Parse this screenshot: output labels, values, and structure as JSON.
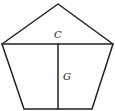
{
  "diagram": {
    "type": "pentagon-decomposition",
    "stroke_color": "#222222",
    "background": "#ffffff",
    "vertices": {
      "apex": [
        58,
        4
      ],
      "left": [
        2,
        44
      ],
      "right": [
        113,
        44
      ],
      "bottom_left": [
        24,
        109
      ],
      "bottom_right": [
        92,
        109
      ]
    },
    "segments": [
      {
        "name": "horizontal-diagonal",
        "from": "left",
        "to": "right",
        "label": "C"
      },
      {
        "name": "vertical-height",
        "from": [
          58,
          44
        ],
        "to": [
          58,
          109
        ],
        "label": "G"
      }
    ],
    "labels": {
      "c": "C",
      "g": "G"
    }
  }
}
